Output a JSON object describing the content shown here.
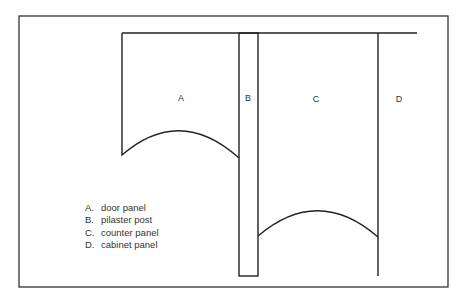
{
  "diagram": {
    "regions": [
      {
        "key": "A",
        "x": 181,
        "y": 98
      },
      {
        "key": "B",
        "x": 248,
        "y": 98
      },
      {
        "key": "C",
        "x": 316,
        "y": 99
      },
      {
        "key": "D",
        "x": 399,
        "y": 99
      }
    ],
    "legend": [
      {
        "key": "A.",
        "label": "door panel"
      },
      {
        "key": "B.",
        "label": "pilaster post"
      },
      {
        "key": "C.",
        "label": "counter panel"
      },
      {
        "key": "D.",
        "label": "cabinet panel"
      }
    ],
    "line_color": "#222222"
  }
}
